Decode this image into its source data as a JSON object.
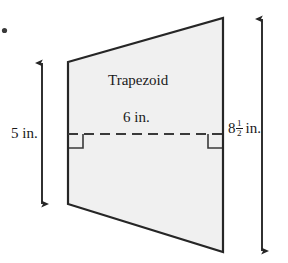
{
  "figure": {
    "type": "geometry-diagram",
    "shape": "trapezoid",
    "shape_label": "Trapezoid",
    "midsegment_label": "6 in.",
    "left_height_label": "5 in.",
    "right_height": {
      "whole": "8",
      "numerator": "1",
      "denominator": "2",
      "unit": "in."
    },
    "bullet_marker": "•",
    "colors": {
      "fill": "#f0f0f0",
      "outline": "#262626",
      "dashed_line": "#3a3a3a",
      "arrow": "#262626",
      "background": "#ffffff",
      "text": "#1a1a1a"
    },
    "measurements": [
      {
        "name": "left-side-height",
        "value": "5",
        "unit": "in."
      },
      {
        "name": "midsegment",
        "value": "6",
        "unit": "in."
      },
      {
        "name": "right-side-height",
        "value": "8 1/2",
        "unit": "in."
      }
    ],
    "right_angle_marks": 2,
    "dimension_arrows": [
      {
        "name": "left-dimension-arrow",
        "orientation": "vertical",
        "double_headed": true
      },
      {
        "name": "right-dimension-arrow",
        "orientation": "vertical",
        "double_headed": true
      }
    ]
  }
}
